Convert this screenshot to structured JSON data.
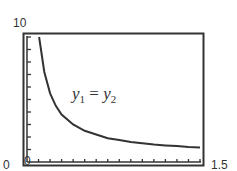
{
  "chart_data": {
    "type": "line",
    "title": "",
    "xlabel": "",
    "ylabel": "",
    "xlim": [
      0,
      1.5
    ],
    "ylim": [
      0,
      10
    ],
    "x_tick_labels": [
      "0",
      "1.5"
    ],
    "y_tick_labels": [
      "0",
      "10"
    ],
    "grid": false,
    "legend": null,
    "annotations": [
      {
        "text": "y1 = y2",
        "display": {
          "lhs": "y",
          "lhs_sub": "1",
          "op": "=",
          "rhs": "y",
          "rhs_sub": "2"
        },
        "x": 0.55,
        "y": 6.0
      }
    ],
    "series": [
      {
        "name": "y1 = y2",
        "x": [
          0.105,
          0.15,
          0.2,
          0.25,
          0.3,
          0.4,
          0.5,
          0.6,
          0.7,
          0.8,
          0.9,
          1.0,
          1.1,
          1.2,
          1.3,
          1.4,
          1.5
        ],
        "values": [
          10.0,
          7.2,
          5.5,
          4.5,
          3.8,
          3.0,
          2.5,
          2.2,
          1.9,
          1.75,
          1.6,
          1.5,
          1.4,
          1.33,
          1.27,
          1.21,
          1.17
        ]
      }
    ],
    "ticks": {
      "x_minor_count": 15,
      "y_minor_count": 10
    }
  },
  "labels": {
    "y_max": "10",
    "y_min": "0",
    "x_min": "0",
    "x_max": "1.5"
  }
}
